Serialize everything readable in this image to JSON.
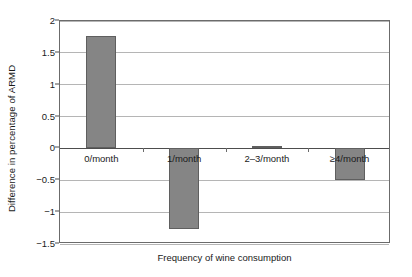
{
  "chart_data": {
    "type": "bar",
    "title": "",
    "xlabel": "Frequency of wine consumption",
    "ylabel": "Difference in percentage of ARMD",
    "categories": [
      "0/month",
      "1/month",
      "2–3/month",
      "≥4/month"
    ],
    "values": [
      1.76,
      -1.27,
      0.04,
      -0.5
    ],
    "ylim": [
      -1.5,
      2
    ],
    "yticks": [
      2,
      1.5,
      1,
      0.5,
      0,
      -0.5,
      -1,
      -1.5
    ],
    "ytick_labels": [
      "2",
      "1.5",
      "1",
      "0.5",
      "0",
      "−0.5",
      "−1",
      "−1.5"
    ],
    "grid": true,
    "legend": "none",
    "bar_color": "#858585",
    "bar_edge_color": "#5f5f5f",
    "grid_color": "#b5b5b5",
    "axis_color": "#6b6b6b",
    "zero_line_color": "#4d4d4d"
  }
}
